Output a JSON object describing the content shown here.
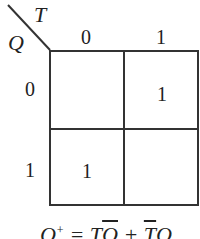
{
  "kmap": {
    "column_variable": "T",
    "row_variable": "Q",
    "column_labels": [
      "0",
      "1"
    ],
    "row_labels": [
      "0",
      "1"
    ],
    "cells": [
      [
        "",
        "1"
      ],
      [
        "1",
        ""
      ]
    ]
  },
  "formula": {
    "lhs": "Q",
    "sup": "+",
    "eq": " = ",
    "t1": "T",
    "q1": "Q",
    "plus": " + ",
    "t2": "T",
    "q2": "Q"
  }
}
